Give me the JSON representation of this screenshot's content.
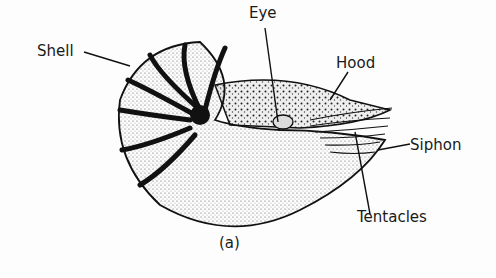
{
  "diagram": {
    "caption": "(a)",
    "labels": {
      "shell": "Shell",
      "eye": "Eye",
      "hood": "Hood",
      "siphon": "Siphon",
      "tentacles": "Tentacles"
    }
  }
}
